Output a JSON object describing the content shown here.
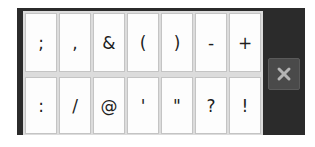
{
  "keyboard": {
    "row1": [
      ";",
      ",",
      "&",
      "(",
      ")",
      "-",
      "+"
    ],
    "row2": [
      ":",
      "/",
      "@",
      "'",
      "\"",
      "?",
      "!"
    ],
    "close_icon": "close-icon"
  },
  "colors": {
    "frame": "#2b2b2b",
    "key_background": "#fdfdfd",
    "key_text": "#1e1e1e",
    "close_button": "#4a4a4a",
    "close_glyph": "#b5b5b5"
  }
}
